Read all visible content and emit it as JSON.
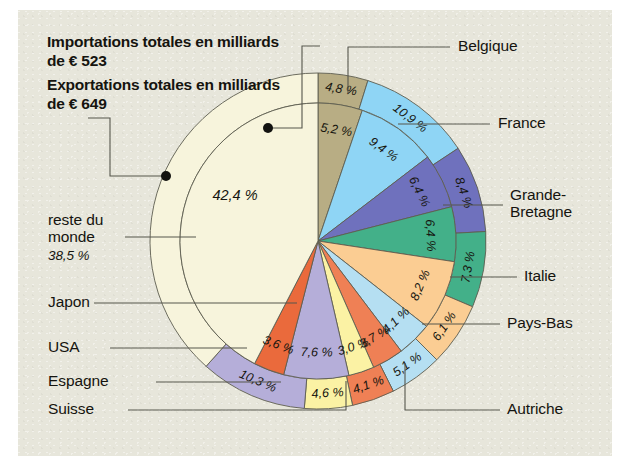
{
  "figure": {
    "background_panel": "#e7e6db",
    "page_background": "#ffffff",
    "header": {
      "imports": "Importations totales\nen milliards de € 523",
      "exports": "Exportations totales\nen milliards\nde € 649"
    }
  },
  "labels": {
    "belgique": "Belgique",
    "france": "France",
    "grande_bretagne": "Grande-\nBretagne",
    "italie": "Italie",
    "pays_bas": "Pays-Bas",
    "autriche": "Autriche",
    "suisse": "Suisse",
    "espagne": "Espagne",
    "usa": "USA",
    "japon": "Japon",
    "reste_du_monde": "reste du\nmonde",
    "reste_du_monde_value": "38,5 %"
  },
  "chart_data": {
    "type": "pie",
    "subtitle": "",
    "xlabel": "",
    "ylabel": "",
    "legend_position": "callout-leader-lines",
    "grid": false,
    "units": "percent",
    "rings": [
      {
        "name": "Importations totales en milliards de € 523",
        "ring": "inner",
        "total_label": "523",
        "total_unit": "milliards de €"
      },
      {
        "name": "Exportations totales en milliards de € 649",
        "ring": "outer",
        "total_label": "649",
        "total_unit": "milliards de €"
      }
    ],
    "categories": [
      "Belgique",
      "France",
      "Grande-Bretagne",
      "Italie",
      "Pays-Bas",
      "Autriche",
      "Suisse",
      "Espagne",
      "USA",
      "Japon",
      "reste du monde"
    ],
    "series": [
      {
        "name": "Importations",
        "ring": "inner",
        "values": [
          5.2,
          9.4,
          6.4,
          6.4,
          8.2,
          4.1,
          3.7,
          3.0,
          7.6,
          3.6,
          42.4
        ],
        "value_labels": [
          "5,2 %",
          "9,4 %",
          "6,4 %",
          "6,4 %",
          "8,2 %",
          "4,1 %",
          "3,7 %",
          "3,0 %",
          "7,6 %",
          "3,6 %",
          "42,4 %"
        ]
      },
      {
        "name": "Exportations",
        "ring": "outer",
        "values": [
          4.8,
          10.9,
          8.4,
          7.3,
          6.1,
          5.1,
          4.1,
          4.6,
          10.3,
          0.0,
          38.5
        ],
        "value_labels": [
          "4,8 %",
          "10,9 %",
          "8,4 %",
          "7,3 %",
          "6,1 %",
          "5,1 %",
          "4,1 %",
          "4,6 %",
          "10,3 %",
          "",
          "38,5 %"
        ]
      }
    ],
    "colors": {
      "Belgique": "#b8ad84",
      "France": "#8fd5f5",
      "Grande-Bretagne": "#6f71bd",
      "Italie": "#43b089",
      "Pays-Bas": "#fbcd93",
      "Autriche": "#b5dff2",
      "Suisse": "#ef8055",
      "Espagne": "#fbf2a4",
      "USA": "#b5aed9",
      "Japon": "#ea6a3c",
      "reste du monde": "#f7f4dc"
    }
  }
}
